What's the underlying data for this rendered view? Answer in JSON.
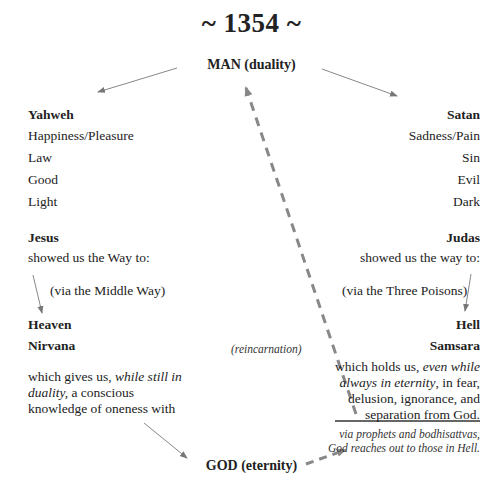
{
  "title": "~ 1354 ~",
  "top_node": "MAN (duality)",
  "bottom_node": "GOD (eternity)",
  "left": {
    "heading": "Yahweh",
    "attributes": [
      "Happiness/Pleasure",
      "Law",
      "Good",
      "Light"
    ],
    "guide": "Jesus",
    "guide_text": "showed us the Way to:",
    "via": "(via the Middle Way)",
    "dest1": "Heaven",
    "dest2": "Nirvana",
    "para_pre": "which gives us, ",
    "para_it": "while still in duality,",
    "para_post": " a conscious knowledge of oneness with"
  },
  "right": {
    "heading": "Satan",
    "attributes": [
      "Sadness/Pain",
      "Sin",
      "Evil",
      "Dark"
    ],
    "guide": "Judas",
    "guide_text": "showed us the way to:",
    "via": "(via the Three Poisons)",
    "dest1": "Hell",
    "dest2": "Samsara",
    "para_pre": "which holds us, ",
    "para_it": "even while always in eternity",
    "para_post": ", in fear, delusion, ignorance, and separation from God.",
    "footnote": "via prophets and bodhisattvas, God reaches out to those in Hell."
  },
  "center_label": "(reincarnation)",
  "colors": {
    "text": "#222222",
    "arrow": "#777777",
    "dashed": "#888888"
  }
}
